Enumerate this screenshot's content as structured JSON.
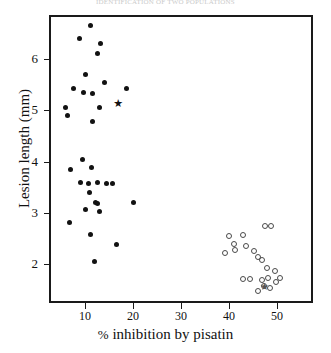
{
  "header": {
    "caption": "IDENTIFICATION OF TWO POPULATIONS"
  },
  "axes": {
    "ylabel": "Lesion length (mm)",
    "xlabel_symbol": "%",
    "xlabel_text": "inhibition by pisatin",
    "xlabel_full": "% inhibition by pisatin",
    "yticks": [
      "2",
      "3",
      "4",
      "5",
      "6"
    ],
    "xticks": [
      "10",
      "20",
      "30",
      "40",
      "50"
    ]
  },
  "chart_data": {
    "type": "scatter",
    "title": "IDENTIFICATION OF TWO POPULATIONS",
    "xlabel": "% inhibition by pisatin",
    "ylabel": "Lesion length (mm)",
    "xlim": [
      2.5,
      57.5
    ],
    "ylim": [
      1.25,
      6.85
    ],
    "xticks": [
      10,
      20,
      30,
      40,
      50
    ],
    "yticks": [
      2,
      3,
      4,
      5,
      6
    ],
    "grid": false,
    "legend": "none",
    "series": [
      {
        "name": "Population A (filled circles)",
        "marker": "filled-circle",
        "color": "#121212",
        "points": [
          [
            11.1,
            6.65
          ],
          [
            8.9,
            6.4
          ],
          [
            13.3,
            6.29
          ],
          [
            12.6,
            6.1
          ],
          [
            10.2,
            5.69
          ],
          [
            14.1,
            5.53
          ],
          [
            7.5,
            5.42
          ],
          [
            9.7,
            5.35
          ],
          [
            11.5,
            5.33
          ],
          [
            13.1,
            5.06
          ],
          [
            6.0,
            5.05
          ],
          [
            6.4,
            4.9
          ],
          [
            18.7,
            5.43
          ],
          [
            11.6,
            4.78
          ],
          [
            9.5,
            4.04
          ],
          [
            11.4,
            3.88
          ],
          [
            7.0,
            3.85
          ],
          [
            9.0,
            3.6
          ],
          [
            10.8,
            3.58
          ],
          [
            12.6,
            3.6
          ],
          [
            14.4,
            3.58
          ],
          [
            15.7,
            3.57
          ],
          [
            11.0,
            3.4
          ],
          [
            12.2,
            3.2
          ],
          [
            12.6,
            3.18
          ],
          [
            10.0,
            3.07
          ],
          [
            13.0,
            3.02
          ],
          [
            20.0,
            3.2
          ],
          [
            6.7,
            2.82
          ],
          [
            11.2,
            2.58
          ],
          [
            16.5,
            2.38
          ],
          [
            12.0,
            2.05
          ]
        ]
      },
      {
        "name": "Population B (open circles)",
        "marker": "open-circle",
        "color": "#4a4a4a",
        "points": [
          [
            47.5,
            2.74
          ],
          [
            48.8,
            2.74
          ],
          [
            40.0,
            2.56
          ],
          [
            42.9,
            2.58
          ],
          [
            41.1,
            2.39
          ],
          [
            41.3,
            2.28
          ],
          [
            43.5,
            2.35
          ],
          [
            45.2,
            2.27
          ],
          [
            39.2,
            2.23
          ],
          [
            46.1,
            2.15
          ],
          [
            46.8,
            2.08
          ],
          [
            47.9,
            1.93
          ],
          [
            49.5,
            1.88
          ],
          [
            43.0,
            1.72
          ],
          [
            44.4,
            1.72
          ],
          [
            46.9,
            1.7
          ],
          [
            48.2,
            1.73
          ],
          [
            50.6,
            1.74
          ],
          [
            47.2,
            1.58
          ],
          [
            48.6,
            1.55
          ],
          [
            49.7,
            1.66
          ],
          [
            46.0,
            1.48
          ]
        ]
      },
      {
        "name": "Marked isolate (filled star)",
        "marker": "filled-star",
        "color": "#121212",
        "points": [
          [
            16.8,
            5.12
          ]
        ]
      },
      {
        "name": "Marked isolate (open star)",
        "marker": "open-star",
        "color": "#555555",
        "points": [
          [
            47.4,
            1.58
          ]
        ]
      }
    ]
  }
}
